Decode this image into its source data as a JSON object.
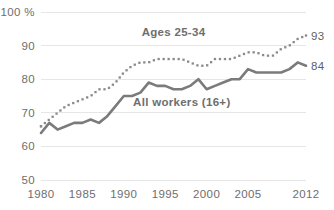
{
  "chart_data": {
    "type": "line",
    "title": "",
    "subtitle": "",
    "xlabel": "",
    "ylabel": "",
    "xlim": [
      1980,
      2012
    ],
    "ylim": [
      50,
      100
    ],
    "grid": true,
    "legend_position": "inline-annotations",
    "y_unit_suffix": "%",
    "y_ticks": [
      "100 %",
      "90",
      "80",
      "70",
      "60",
      "50"
    ],
    "y_tick_values": [
      100,
      90,
      80,
      70,
      60,
      50
    ],
    "x_ticks": [
      "1980",
      "1985",
      "1990",
      "1995",
      "2000",
      "2005",
      "2012"
    ],
    "x_tick_values": [
      1980,
      1985,
      1990,
      1995,
      2000,
      2005,
      2012
    ],
    "x": [
      1980,
      1981,
      1982,
      1983,
      1984,
      1985,
      1986,
      1987,
      1988,
      1989,
      1990,
      1991,
      1992,
      1993,
      1994,
      1995,
      1996,
      1997,
      1998,
      1999,
      2000,
      2001,
      2002,
      2003,
      2004,
      2005,
      2006,
      2007,
      2008,
      2009,
      2010,
      2011,
      2012
    ],
    "series": [
      {
        "name": "Ages 25-34",
        "style": "dotted",
        "color": "#8a8a8a",
        "label": "Ages 25-34",
        "end_label": "93",
        "end_value": 93,
        "values": [
          66,
          68,
          70,
          72,
          73,
          74,
          75,
          77,
          77,
          79,
          82,
          84,
          85,
          85,
          86,
          86,
          86,
          86,
          85,
          84,
          84,
          86,
          86,
          86,
          87,
          88,
          88,
          87,
          87,
          89,
          90,
          92,
          93
        ]
      },
      {
        "name": "All workers (16+)",
        "style": "solid",
        "color": "#7b7b7b",
        "label": "All workers (16+)",
        "end_label": "84",
        "end_value": 84,
        "values": [
          64,
          67,
          65,
          66,
          67,
          67,
          68,
          67,
          69,
          72,
          75,
          75,
          76,
          79,
          78,
          78,
          77,
          77,
          78,
          80,
          77,
          78,
          79,
          80,
          80,
          83,
          82,
          82,
          82,
          82,
          83,
          85,
          84
        ]
      }
    ],
    "annotations": [
      {
        "text": "Ages 25-34",
        "x": 1996,
        "y": 93
      },
      {
        "text": "All workers (16+)",
        "x": 1997,
        "y": 72
      }
    ]
  }
}
